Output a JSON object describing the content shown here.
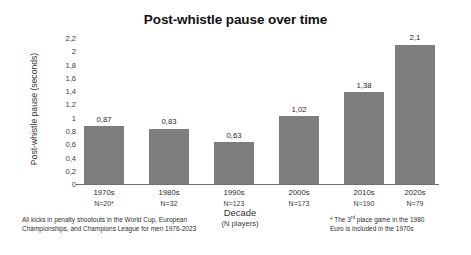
{
  "chart_data": {
    "type": "bar",
    "title": "Post-whistle pause over time",
    "xlabel": "Decade",
    "xlabel_sub": "(N players)",
    "ylabel": "Post-whistle pause (seconds)",
    "ylim": [
      0,
      2.2
    ],
    "ytick_step": 0.2,
    "grid": false,
    "legend": null,
    "decimal_separator": ",",
    "bar_color": "#7d7d7d",
    "categories": [
      "1970s",
      "1980s",
      "1990s",
      "2000s",
      "2010s",
      "2020s"
    ],
    "category_counts": [
      "N=20*",
      "N=32",
      "N=123",
      "N=173",
      "N=190",
      "N=79"
    ],
    "values": [
      0.87,
      0.83,
      0.63,
      1.02,
      1.38,
      2.1
    ],
    "value_labels": [
      "0,87",
      "0,83",
      "0,63",
      "1,02",
      "1,38",
      "2,1"
    ],
    "ytick_labels": [
      "2,2",
      "2",
      "1,8",
      "1,6",
      "1,4",
      "1,2",
      "1",
      "0,8",
      "0,6",
      "0,4",
      "0,2",
      "0"
    ],
    "ytick_values": [
      2.2,
      2.0,
      1.8,
      1.6,
      1.4,
      1.2,
      1.0,
      0.8,
      0.6,
      0.4,
      0.2,
      0
    ],
    "annotations": {
      "footnote_left_line1": "All kicks in penalty shootouts in the World Cup, European",
      "footnote_left_line2": "Championships, and Champions League for men 1976-2023",
      "footnote_right_line1_pre": "* The 3",
      "footnote_right_line1_sup": "rd",
      "footnote_right_line1_post": " place game in the 1980",
      "footnote_right_line2": "Euro is included in the 1970s"
    }
  }
}
